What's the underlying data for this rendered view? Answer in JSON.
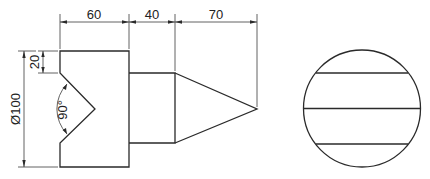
{
  "drawing": {
    "type": "orthographic-technical-drawing",
    "views": [
      "front-view",
      "side-view"
    ],
    "dimensions": {
      "length_base": "60",
      "length_cylinder": "40",
      "length_cone": "70",
      "notch_depth": "20",
      "diameter": "Ø100",
      "notch_angle": "90°"
    },
    "colors": {
      "line": "#2a2a2a",
      "background": "#ffffff"
    }
  }
}
